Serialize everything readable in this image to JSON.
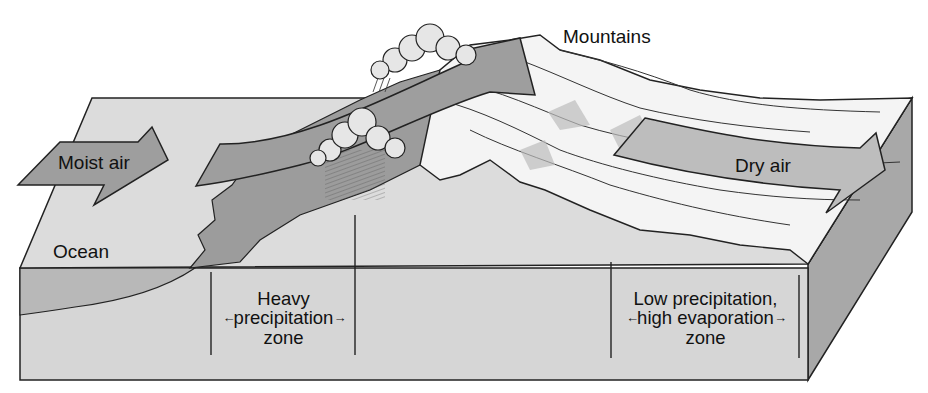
{
  "diagram": {
    "colors": {
      "background": "#ffffff",
      "ocean_surface": "#dcdcdc",
      "block_front": "#d6d6d6",
      "block_side": "#a8a8a8",
      "ocean_section": "#b8b8b8",
      "windward_slope": "#9c9c9c",
      "mountains": "#f4f4f4",
      "arrow_fill": "#9e9e9e",
      "dry_arrow_fill": "#bdbdbd",
      "outline": "#222222"
    },
    "labels": {
      "mountains": "Mountains",
      "moist_air": "Moist air",
      "dry_air": "Dry air",
      "ocean": "Ocean"
    },
    "zones": [
      {
        "id": "heavy-precipitation",
        "lines": [
          "Heavy",
          "precipitation",
          "zone"
        ],
        "arrow_left": "←",
        "arrow_right": "→"
      },
      {
        "id": "low-precipitation-high-evaporation",
        "lines": [
          "Low precipitation,",
          "high evaporation",
          "zone"
        ],
        "arrow_left": "←",
        "arrow_right": "→"
      }
    ],
    "icons": [
      "cloud-icon",
      "rain-icon",
      "wind-arrow-icon"
    ]
  }
}
